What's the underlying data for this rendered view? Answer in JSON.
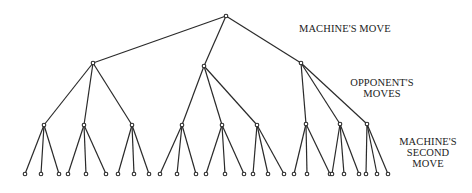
{
  "diagram": {
    "type": "game-tree",
    "labels": {
      "level0": {
        "lines": [
          "MACHINE'S MOVE"
        ]
      },
      "level1": {
        "lines": [
          "OPPONENT'S",
          "MOVES"
        ]
      },
      "level2": {
        "lines": [
          "MACHINE'S",
          "SECOND",
          "MOVE"
        ]
      }
    },
    "colors": {
      "line": "#2a2a2a",
      "text": "#222222",
      "background": "#ffffff"
    },
    "root": {
      "x": 226,
      "y": 16
    },
    "level1_nodes": [
      {
        "x": 93,
        "y": 63
      },
      {
        "x": 204,
        "y": 66
      },
      {
        "x": 301,
        "y": 63
      }
    ],
    "level2_nodes": [
      {
        "parent": 0,
        "x": 44,
        "y": 125,
        "leaves": [
          25,
          41,
          59
        ]
      },
      {
        "parent": 0,
        "x": 84,
        "y": 125,
        "leaves": [
          68,
          86,
          106
        ]
      },
      {
        "parent": 0,
        "x": 132,
        "y": 125,
        "leaves": [
          118,
          134,
          149
        ]
      },
      {
        "parent": 1,
        "x": 182,
        "y": 125,
        "leaves": [
          160,
          177,
          196
        ]
      },
      {
        "parent": 1,
        "x": 222,
        "y": 125,
        "leaves": [
          206,
          225,
          244
        ]
      },
      {
        "parent": 1,
        "x": 257,
        "y": 125,
        "leaves": [
          253,
          268,
          284
        ]
      },
      {
        "parent": 2,
        "x": 306,
        "y": 124,
        "leaves": [
          294,
          307,
          330
        ]
      },
      {
        "parent": 2,
        "x": 340,
        "y": 124,
        "leaves": [
          332,
          344,
          359
        ]
      },
      {
        "parent": 2,
        "x": 367,
        "y": 124,
        "leaves": [
          366,
          377,
          388
        ]
      }
    ],
    "leaf_y": 174
  }
}
